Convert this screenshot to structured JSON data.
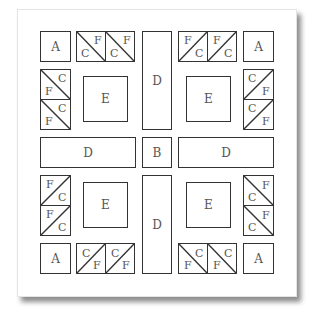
{
  "diagram": {
    "type": "quilt-block-layout",
    "line_color": "#333333",
    "label_color": "#555555",
    "pieces": {
      "A": "A",
      "B": "B",
      "D": "D",
      "E": "E"
    },
    "hst_labels": {
      "C": "C",
      "F": "F"
    },
    "layout": [
      [
        "A",
        "CF-pair",
        "D",
        "FC-pair",
        "A"
      ],
      [
        "FC-stack",
        "E",
        "D",
        "E",
        "CF-stack"
      ],
      [
        "D",
        "D",
        "B",
        "D",
        "D"
      ],
      [
        "FC-stack",
        "E",
        "D",
        "E",
        "CF-stack"
      ],
      [
        "A",
        "CF-pair",
        "D",
        "FC-pair",
        "A"
      ]
    ]
  }
}
